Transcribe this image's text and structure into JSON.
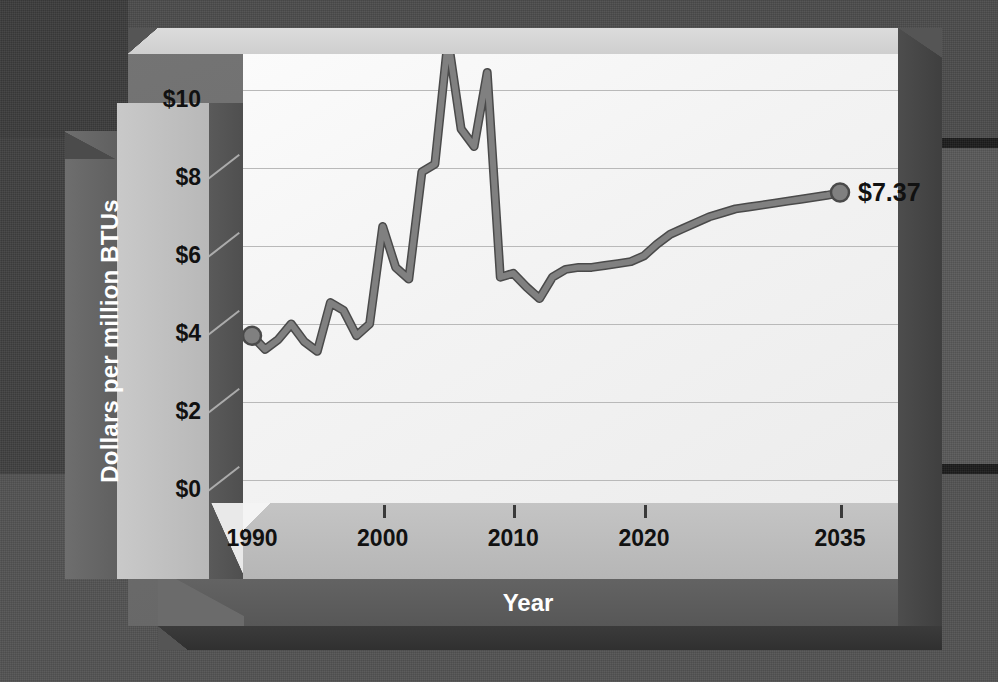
{
  "chart_data": {
    "type": "line",
    "title": "",
    "xlabel": "Year",
    "ylabel": "Dollars per million BTUs",
    "xlim": [
      1988,
      2037
    ],
    "ylim": [
      0,
      11.5
    ],
    "grid": true,
    "legend": null,
    "y_ticks": [
      "$0",
      "$2",
      "$4",
      "$6",
      "$8",
      "$10"
    ],
    "y_tick_values": [
      0,
      2,
      4,
      6,
      8,
      10
    ],
    "x_ticks": [
      "1990",
      "2000",
      "2010",
      "2020",
      "2035"
    ],
    "x_tick_values": [
      1990,
      2000,
      2010,
      2020,
      2035
    ],
    "series_name": "Natural gas price",
    "line_color": "#808080",
    "line_outline_color": "#4a4a4a",
    "marker_shape": "circle",
    "end_label": "$7.37",
    "start_label": "",
    "x": [
      1990,
      1991,
      1992,
      1993,
      1994,
      1995,
      1996,
      1997,
      1998,
      1999,
      2000,
      2001,
      2002,
      2003,
      2004,
      2005,
      2006,
      2007,
      2008,
      2009,
      2010,
      2011,
      2012,
      2013,
      2014,
      2015,
      2016,
      2017,
      2018,
      2019,
      2020,
      2021,
      2022,
      2023,
      2024,
      2025,
      2026,
      2027,
      2028,
      2029,
      2030,
      2031,
      2032,
      2033,
      2034,
      2035
    ],
    "y": [
      3.7,
      3.35,
      3.6,
      4.0,
      3.55,
      3.3,
      4.55,
      4.35,
      3.7,
      4.0,
      6.5,
      5.45,
      5.15,
      7.9,
      8.1,
      11.3,
      9.0,
      8.55,
      10.45,
      5.2,
      5.3,
      4.95,
      4.65,
      5.2,
      5.4,
      5.45,
      5.45,
      5.5,
      5.55,
      5.6,
      5.75,
      6.05,
      6.3,
      6.45,
      6.6,
      6.75,
      6.85,
      6.95,
      7.0,
      7.05,
      7.1,
      7.15,
      7.2,
      7.25,
      7.3,
      7.37
    ],
    "values_note": "Dollars per million BTUs"
  },
  "axes": {
    "y_title": "Dollars per million BTUs",
    "x_title": "Year",
    "y_tick_labels": [
      "$10",
      "$8",
      "$6",
      "$4",
      "$2",
      "$0"
    ],
    "x_tick_labels": [
      "1990",
      "2000",
      "2010",
      "2020",
      "2035"
    ]
  },
  "annotations": {
    "end_value_label": "$7.37"
  },
  "colors": {
    "backdrop": "#555555",
    "frame": "#6b6b6b",
    "plot_bg": "#f4f4f4",
    "pillar_face": "#c3c3c3",
    "line": "#808080",
    "line_stroke": "#4a4a4a",
    "axis_text": "#111111",
    "title_text": "#ffffff"
  }
}
